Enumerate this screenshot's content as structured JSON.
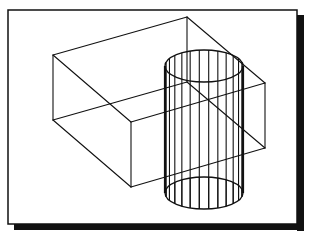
{
  "figure": {
    "colors": {
      "background": "#ffffff",
      "stroke": "#111111",
      "shadow": "#111111"
    },
    "frame": {
      "x": 8,
      "y": 10,
      "width": 289,
      "height": 214,
      "shadow_offset": 7
    },
    "box": {
      "top": [
        [
          53,
          55
        ],
        [
          187,
          17
        ],
        [
          265,
          83
        ],
        [
          131,
          122
        ]
      ],
      "bottom": [
        [
          53,
          120
        ],
        [
          187,
          82
        ],
        [
          265,
          148
        ],
        [
          131,
          187
        ]
      ]
    },
    "cylinder": {
      "cx": 204,
      "top_cy": 66,
      "bottom_cy": 193,
      "rx": 39,
      "ry": 16,
      "generator_lines": 14
    }
  }
}
